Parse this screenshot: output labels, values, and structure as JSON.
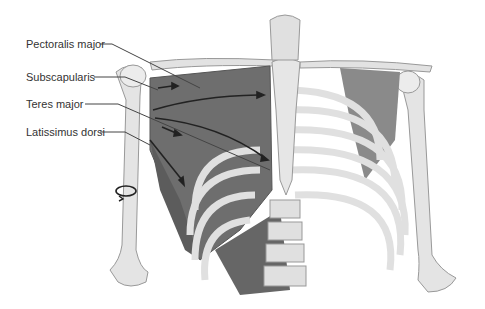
{
  "diagram": {
    "labels": [
      {
        "id": "pectoralis",
        "text": "Pectoralis major"
      },
      {
        "id": "subscapularis",
        "text": "Subscapularis"
      },
      {
        "id": "teres",
        "text": "Teres major"
      },
      {
        "id": "latissimus",
        "text": "Latissimus dorsi"
      }
    ],
    "annotations": {
      "rotation_symbol": "internal-rotation-arrow around right humerus"
    },
    "colors": {
      "muscle": "#6e6e6e",
      "bone": "#e2e2e2",
      "bone_outline": "#9a9a9a",
      "arrow": "#222222",
      "leader_line": "#444444",
      "text": "#333333"
    }
  }
}
